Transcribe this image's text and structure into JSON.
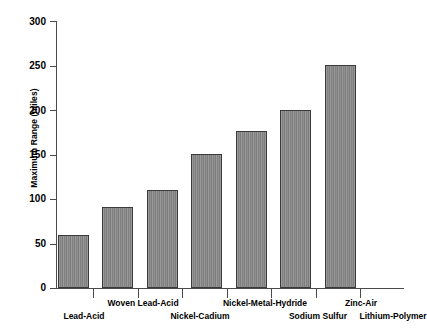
{
  "chart_data": {
    "type": "bar",
    "title": "",
    "subtitle": "",
    "xlabel": "",
    "ylabel": "Maximum Range (miles)",
    "categories": [
      "Lead-Acid",
      "Woven Lead-Acid",
      "Nickel-Cadium",
      "Nickel-Metal-Hydride",
      "Sodium Sulfur",
      "Zinc-Air",
      "Lithium-Polymer"
    ],
    "values": [
      60,
      91,
      111,
      151,
      177,
      201,
      251
    ],
    "ylim": [
      0,
      300
    ],
    "ytick_labels": [
      "0",
      "50",
      "100",
      "150",
      "200",
      "250",
      "300"
    ],
    "ytick_values": [
      0,
      50,
      100,
      150,
      200,
      250,
      300
    ],
    "grid": false,
    "legend": false,
    "legend_position": "none",
    "bar_fill_color": "#8e8e8e",
    "bar_edge_color": "#3a3a3a",
    "axis_color": "#4a4a4a",
    "background_color": "#ffffff",
    "label_layout": "staggered-two-row",
    "label_rows": [
      {
        "category": "Lead-Acid",
        "row": "bottom"
      },
      {
        "category": "Woven Lead-Acid",
        "row": "top"
      },
      {
        "category": "Nickel-Cadium",
        "row": "bottom"
      },
      {
        "category": "Nickel-Metal-Hydride",
        "row": "top"
      },
      {
        "category": "Sodium Sulfur",
        "row": "bottom"
      },
      {
        "category": "Zinc-Air",
        "row": "top"
      },
      {
        "category": "Lithium-Polymer",
        "row": "bottom"
      }
    ]
  }
}
